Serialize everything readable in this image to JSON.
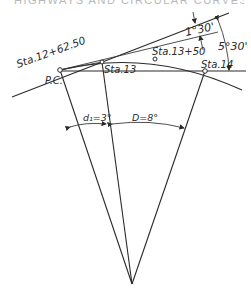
{
  "page_header": "HIGHWAYS AND CIRCULAR CURVES",
  "diagram": {
    "points": {
      "pc_station": "Sta.12+62.50",
      "pc_label": "P.C.",
      "sta13": "Sta.13",
      "sta13_50": "Sta.13+50",
      "sta14": "Sta.14"
    },
    "angles": {
      "deflection_small": "1°30'",
      "deflection_large": "5°30'",
      "central_partial": "d₁=3°",
      "central_degree": "D=8°"
    },
    "colors": {
      "line": "#2a2a2a",
      "background": "#ffffff"
    }
  }
}
